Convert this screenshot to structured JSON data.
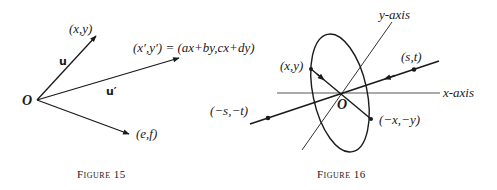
{
  "figure15": {
    "caption": "Figure 15",
    "origin_label": "O",
    "vectors": [
      {
        "name": "u",
        "label": "u",
        "endpoint_label": "(x,y)"
      },
      {
        "name": "u_prime",
        "label": "u′",
        "endpoint_label": "(x′,y′) = (ax+by,cx+dy)"
      },
      {
        "name": "ef",
        "label": "",
        "endpoint_label": "(e,f)"
      }
    ]
  },
  "figure16": {
    "caption": "Figure 16",
    "origin_label": "O",
    "x_axis_label": "x-axis",
    "y_axis_label": "y-axis",
    "points": [
      {
        "name": "xy",
        "label": "(x,y)"
      },
      {
        "name": "neg_xy",
        "label": "(−x,−y)"
      },
      {
        "name": "st",
        "label": "(s,t)"
      },
      {
        "name": "neg_st",
        "label": "(−s,−t)"
      }
    ]
  }
}
